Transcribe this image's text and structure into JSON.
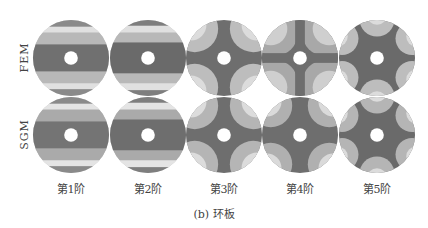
{
  "figure": {
    "caption": "(b) 环板",
    "row_labels": [
      "FEM",
      "SGM"
    ],
    "column_labels": [
      "第1阶",
      "第2阶",
      "第3阶",
      "第4阶",
      "第5阶"
    ],
    "panels": [
      {
        "row": "FEM",
        "mode": "第1阶",
        "pattern": "horizontal-bands"
      },
      {
        "row": "FEM",
        "mode": "第2阶",
        "pattern": "horizontal-bands"
      },
      {
        "row": "FEM",
        "mode": "第3阶",
        "pattern": "cross-4-arms"
      },
      {
        "row": "FEM",
        "mode": "第4阶",
        "pattern": "cross-4-arms"
      },
      {
        "row": "FEM",
        "mode": "第5阶",
        "pattern": "star-6-arms"
      },
      {
        "row": "SGM",
        "mode": "第1阶",
        "pattern": "horizontal-bands"
      },
      {
        "row": "SGM",
        "mode": "第2阶",
        "pattern": "horizontal-bands"
      },
      {
        "row": "SGM",
        "mode": "第3阶",
        "pattern": "cross-4-arms"
      },
      {
        "row": "SGM",
        "mode": "第4阶",
        "pattern": "cross-4-arms"
      },
      {
        "row": "SGM",
        "mode": "第5阶",
        "pattern": "star-6-arms"
      }
    ],
    "colors": {
      "dark": "#6e6e6e",
      "mid": "#9a9a9a",
      "light": "#c4c4c4",
      "lightest": "#e2e2e2",
      "hole": "#ffffff"
    }
  }
}
